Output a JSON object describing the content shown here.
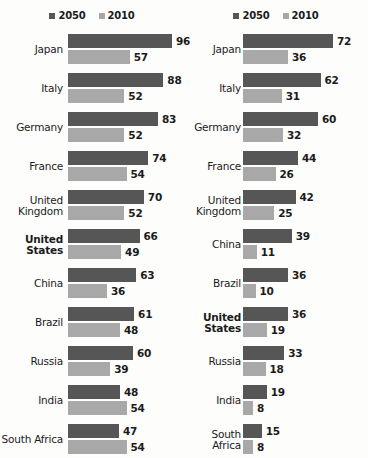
{
  "chart_data": [
    {
      "type": "bar",
      "orientation": "horizontal",
      "title": "",
      "xlabel": "",
      "ylabel": "",
      "grid": false,
      "legend_position": "top-center",
      "xlim": [
        0,
        96
      ],
      "categories": [
        "Japan",
        "Italy",
        "Germany",
        "France",
        "United\nKingdom",
        "United\nStates",
        "China",
        "Brazil",
        "Russia",
        "India",
        "South Africa"
      ],
      "emphasized_categories": [
        "United\nStates"
      ],
      "series": [
        {
          "name": "2050",
          "color": "#565656",
          "values": [
            96,
            88,
            83,
            74,
            70,
            66,
            63,
            61,
            60,
            48,
            47
          ]
        },
        {
          "name": "2010",
          "color": "#a8a8a8",
          "values": [
            57,
            52,
            52,
            54,
            52,
            49,
            36,
            48,
            39,
            54,
            54
          ]
        }
      ]
    },
    {
      "type": "bar",
      "orientation": "horizontal",
      "title": "",
      "xlabel": "",
      "ylabel": "",
      "grid": false,
      "legend_position": "top-center",
      "xlim": [
        0,
        72
      ],
      "categories": [
        "Japan",
        "Italy",
        "Germany",
        "France",
        "United\nKingdom",
        "China",
        "Brazil",
        "United\nStates",
        "Russia",
        "India",
        "South Africa"
      ],
      "emphasized_categories": [
        "United\nStates"
      ],
      "series": [
        {
          "name": "2050",
          "color": "#565656",
          "values": [
            72,
            62,
            60,
            44,
            42,
            39,
            36,
            36,
            33,
            19,
            15
          ]
        },
        {
          "name": "2010",
          "color": "#a8a8a8",
          "values": [
            36,
            31,
            32,
            26,
            25,
            11,
            10,
            19,
            18,
            8,
            8
          ]
        }
      ]
    }
  ],
  "legend": {
    "items": [
      {
        "label": "2050",
        "color": "#565656"
      },
      {
        "label": "2010",
        "color": "#a8a8a8"
      }
    ]
  }
}
